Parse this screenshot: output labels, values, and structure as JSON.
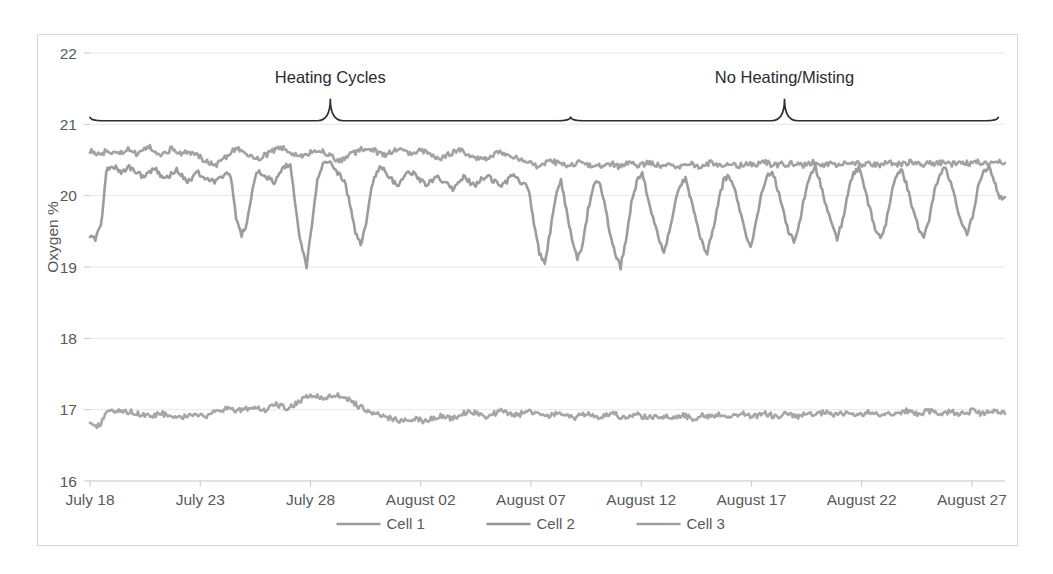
{
  "figure": {
    "background_color": "#ffffff",
    "border_color": "#d6d6d6"
  },
  "chart_data": {
    "type": "line",
    "title": "",
    "xlabel": "",
    "ylabel": "Oxygen %",
    "ylim": [
      16,
      22
    ],
    "yticks": [
      16,
      17,
      18,
      19,
      20,
      21,
      22
    ],
    "ytick_labels": [
      "16",
      "17",
      "18",
      "19",
      "20",
      "21",
      "22"
    ],
    "grid": true,
    "grid_color": "#e8e8e8",
    "legend_position": "bottom",
    "x_axis_type": "date",
    "xtick_labels": [
      "July 18",
      "July 23",
      "July 28",
      "August 02",
      "August 07",
      "August 12",
      "August 17",
      "August 22",
      "August 27"
    ],
    "xtick_positions": [
      0,
      5,
      10,
      15,
      20,
      25,
      30,
      35,
      40
    ],
    "x_range": [
      0,
      41.5
    ],
    "series": [
      {
        "name": "Cell 1",
        "color": "#9a9a9a",
        "mean_value": 20.55,
        "description": "Stable near 20.5-20.65 percent throughout the record",
        "values": [
          20.62,
          20.6,
          20.58,
          20.63,
          20.61,
          20.57,
          20.62,
          20.66,
          20.6,
          20.58,
          20.64,
          20.69,
          20.62,
          20.58,
          20.61,
          20.66,
          20.63,
          20.59,
          20.62,
          20.6,
          20.55,
          20.5,
          20.46,
          20.42,
          20.48,
          20.55,
          20.62,
          20.68,
          20.63,
          20.58,
          20.55,
          20.52,
          20.56,
          20.6,
          20.64,
          20.68,
          20.64,
          20.6,
          20.57,
          20.54,
          20.58,
          20.62,
          20.66,
          20.6,
          20.56,
          20.52,
          20.49,
          20.53,
          20.58,
          20.62,
          20.65,
          20.68,
          20.64,
          20.6,
          20.57,
          20.6,
          20.63,
          20.66,
          20.62,
          20.58,
          20.61,
          20.64,
          20.6,
          20.56,
          20.52,
          20.55,
          20.58,
          20.62,
          20.65,
          20.6,
          20.56,
          20.53,
          20.5,
          20.54,
          20.58,
          20.62,
          20.6,
          20.57,
          20.54,
          20.51,
          20.48,
          20.45,
          20.42,
          20.44,
          20.46,
          20.48,
          20.45,
          20.43,
          20.41,
          20.44,
          20.47,
          20.45,
          20.42,
          20.4,
          20.43,
          20.46,
          20.44,
          20.41,
          20.43,
          20.46,
          20.44,
          20.42,
          20.45,
          20.47,
          20.44,
          20.42,
          20.45,
          20.43,
          20.41,
          20.44,
          20.46,
          20.43,
          20.41,
          20.44,
          20.46,
          20.44,
          20.42,
          20.45,
          20.43,
          20.41,
          20.44,
          20.46,
          20.43,
          20.45,
          20.47,
          20.44,
          20.42,
          20.45,
          20.43,
          20.46,
          20.44,
          20.42,
          20.45,
          20.47,
          20.44,
          20.42,
          20.45,
          20.43,
          20.46,
          20.44,
          20.47,
          20.45,
          20.43,
          20.46,
          20.44,
          20.42,
          20.45,
          20.47,
          20.45,
          20.43,
          20.46,
          20.48,
          20.45,
          20.43,
          20.46,
          20.44,
          20.47,
          20.45,
          20.43,
          20.46,
          20.48,
          20.46,
          20.44,
          20.47,
          20.45,
          20.43,
          20.46,
          20.48,
          20.46
        ]
      },
      {
        "name": "Cell 2",
        "color": "#949494",
        "mean_value": 20.1,
        "description": "Starts at 19.4, recovers to ~20.4 with heating cycle dips to 19.0; after August 07 shows regular daily oscillations between 19.0 and 20.4",
        "values": [
          19.45,
          19.4,
          19.55,
          20.35,
          20.42,
          20.38,
          20.33,
          20.4,
          20.36,
          20.3,
          20.26,
          20.32,
          20.38,
          20.3,
          20.24,
          20.3,
          20.36,
          20.28,
          20.2,
          20.26,
          20.32,
          20.28,
          20.22,
          20.18,
          20.24,
          20.3,
          20.26,
          19.7,
          19.45,
          19.6,
          20.1,
          20.35,
          20.3,
          20.24,
          20.18,
          20.3,
          20.4,
          20.45,
          19.8,
          19.3,
          19.0,
          19.6,
          20.2,
          20.45,
          20.5,
          20.4,
          20.3,
          20.2,
          19.9,
          19.5,
          19.3,
          19.6,
          20.1,
          20.35,
          20.4,
          20.3,
          20.2,
          20.15,
          20.25,
          20.35,
          20.3,
          20.22,
          20.15,
          20.2,
          20.28,
          20.22,
          20.16,
          20.1,
          20.18,
          20.26,
          20.2,
          20.14,
          20.2,
          20.28,
          20.24,
          20.18,
          20.12,
          20.2,
          20.28,
          20.22,
          20.16,
          20.1,
          19.6,
          19.2,
          19.05,
          19.5,
          20.0,
          20.2,
          19.8,
          19.4,
          19.1,
          19.3,
          19.8,
          20.15,
          20.2,
          19.9,
          19.5,
          19.2,
          19.0,
          19.4,
          19.9,
          20.2,
          20.3,
          20.0,
          19.7,
          19.4,
          19.2,
          19.5,
          19.9,
          20.15,
          20.25,
          19.95,
          19.65,
          19.35,
          19.2,
          19.5,
          19.9,
          20.2,
          20.3,
          20.1,
          19.8,
          19.5,
          19.3,
          19.6,
          20.0,
          20.25,
          20.35,
          20.1,
          19.8,
          19.5,
          19.35,
          19.6,
          20.0,
          20.3,
          20.4,
          20.15,
          19.85,
          19.6,
          19.4,
          19.65,
          20.05,
          20.3,
          20.38,
          20.12,
          19.82,
          19.55,
          19.38,
          19.62,
          20.02,
          20.28,
          20.36,
          20.1,
          19.8,
          19.55,
          19.4,
          19.68,
          20.08,
          20.3,
          20.4,
          20.18,
          19.9,
          19.62,
          19.45,
          19.7,
          20.1,
          20.32,
          20.42,
          20.2,
          19.95,
          19.98
        ]
      },
      {
        "name": "Cell 3",
        "color": "#9e9e9e",
        "mean_value": 16.95,
        "description": "Flat band near 16.8-17.2 percent for the whole record",
        "values": [
          16.78,
          16.75,
          16.8,
          16.95,
          17.0,
          16.98,
          16.95,
          16.97,
          16.96,
          16.94,
          16.92,
          16.9,
          16.93,
          16.95,
          16.92,
          16.9,
          16.88,
          16.9,
          16.93,
          16.95,
          16.92,
          16.9,
          16.94,
          16.98,
          17.0,
          17.02,
          17.0,
          16.98,
          17.0,
          17.03,
          17.05,
          17.02,
          17.0,
          17.04,
          17.08,
          17.05,
          17.02,
          17.06,
          17.1,
          17.15,
          17.18,
          17.2,
          17.18,
          17.16,
          17.18,
          17.2,
          17.18,
          17.15,
          17.1,
          17.05,
          17.02,
          16.98,
          16.95,
          16.92,
          16.9,
          16.88,
          16.86,
          16.84,
          16.86,
          16.88,
          16.86,
          16.84,
          16.86,
          16.9,
          16.92,
          16.9,
          16.88,
          16.9,
          16.94,
          16.98,
          16.96,
          16.93,
          16.9,
          16.92,
          16.95,
          16.98,
          16.96,
          16.94,
          16.92,
          16.95,
          16.98,
          16.96,
          16.93,
          16.9,
          16.92,
          16.95,
          16.93,
          16.9,
          16.88,
          16.9,
          16.93,
          16.95,
          16.92,
          16.9,
          16.92,
          16.95,
          16.93,
          16.9,
          16.88,
          16.9,
          16.93,
          16.9,
          16.88,
          16.9,
          16.92,
          16.9,
          16.88,
          16.9,
          16.93,
          16.9,
          16.88,
          16.9,
          16.92,
          16.9,
          16.92,
          16.94,
          16.92,
          16.9,
          16.92,
          16.95,
          16.93,
          16.9,
          16.92,
          16.95,
          16.93,
          16.9,
          16.92,
          16.94,
          16.92,
          16.9,
          16.92,
          16.94,
          16.92,
          16.94,
          16.96,
          16.94,
          16.92,
          16.94,
          16.96,
          16.94,
          16.92,
          16.94,
          16.96,
          16.94,
          16.92,
          16.94,
          16.96,
          16.94,
          16.96,
          16.98,
          16.96,
          16.94,
          16.96,
          16.98,
          16.96,
          16.94,
          16.96,
          16.98,
          16.96,
          16.94,
          16.96,
          16.98,
          16.96,
          16.94,
          16.96,
          16.98,
          16.96,
          16.94
        ]
      }
    ],
    "annotations": [
      {
        "name": "heating-cycles",
        "text": "Heating Cycles",
        "type": "brace",
        "x_start": 0,
        "x_end": 21.8,
        "label_x": 10.9,
        "y_level": 21.05
      },
      {
        "name": "no-heating-misting",
        "text": "No Heating/Misting",
        "type": "brace",
        "x_start": 21.8,
        "x_end": 41.2,
        "label_x": 31.5,
        "y_level": 21.05
      }
    ]
  },
  "legend": {
    "items": [
      {
        "label": "Cell 1",
        "color": "#9a9a9a"
      },
      {
        "label": "Cell 2",
        "color": "#949494"
      },
      {
        "label": "Cell 3",
        "color": "#9e9e9e"
      }
    ]
  }
}
